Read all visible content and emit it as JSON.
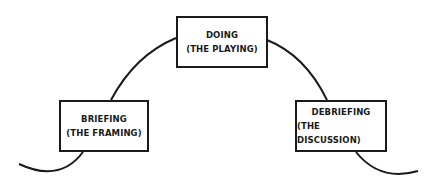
{
  "diagram": {
    "stages": [
      {
        "title": "BRIEFING",
        "subtitle": "(THE FRAMING)"
      },
      {
        "title": "DOING",
        "subtitle": "(THE PLAYING)"
      },
      {
        "title": "DEBRIEFING",
        "subtitle": "(THE DISCUSSION)"
      }
    ],
    "line_color": "#1a1a1a"
  }
}
